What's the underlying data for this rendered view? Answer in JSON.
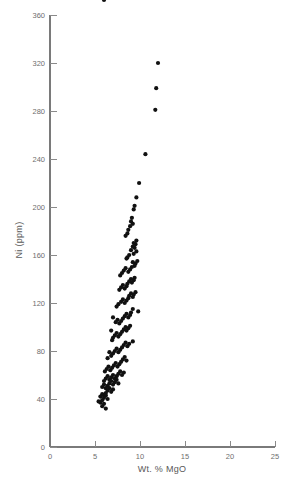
{
  "chart_data": {
    "type": "scatter",
    "title": "",
    "xlabel": "Wt. % MgO",
    "ylabel": "Ni (ppm)",
    "xlim": [
      0,
      25
    ],
    "ylim": [
      0,
      360
    ],
    "xticks": [
      0,
      5,
      10,
      15,
      20,
      25
    ],
    "yticks": [
      0,
      40,
      80,
      120,
      160,
      200,
      240,
      280,
      320,
      360
    ],
    "xtick_labels": [
      "0",
      "5",
      "10",
      "15",
      "20",
      "25"
    ],
    "ytick_labels": [
      "0",
      "40",
      "80",
      "120",
      "160",
      "200",
      "240",
      "280",
      "320",
      "360"
    ],
    "grid": false,
    "legend": null,
    "marker": "filled-circle",
    "marker_color": "#111111",
    "marker_size_px": 4.0,
    "n_points": 152,
    "x": [
      12.0,
      11.8,
      11.7,
      10.6,
      9.9,
      9.6,
      9.4,
      9.3,
      9.1,
      9.0,
      9.2,
      8.9,
      8.7,
      8.6,
      8.4,
      9.6,
      9.5,
      9.4,
      9.3,
      9.2,
      9.6,
      9.3,
      9.0,
      8.8,
      8.6,
      8.5,
      9.7,
      9.5,
      9.4,
      9.2,
      9.1,
      8.9,
      8.7,
      8.4,
      8.2,
      8.0,
      7.8,
      9.4,
      9.3,
      9.1,
      9.0,
      8.8,
      8.6,
      8.5,
      8.3,
      8.1,
      7.9,
      7.7,
      9.5,
      9.3,
      9.2,
      9.0,
      8.8,
      8.7,
      8.5,
      8.3,
      8.1,
      7.9,
      7.6,
      7.4,
      9.8,
      9.2,
      9.0,
      8.9,
      8.7,
      8.5,
      8.3,
      8.1,
      7.9,
      7.7,
      7.5,
      7.3,
      7.0,
      6.8,
      8.9,
      8.7,
      8.5,
      8.4,
      8.2,
      8.0,
      7.8,
      7.6,
      7.4,
      7.2,
      7.0,
      6.9,
      9.2,
      8.8,
      8.6,
      8.4,
      8.2,
      8.0,
      7.8,
      7.6,
      7.4,
      7.2,
      7.0,
      6.8,
      6.6,
      6.4,
      8.5,
      8.3,
      8.1,
      7.9,
      7.7,
      7.5,
      7.3,
      7.1,
      6.9,
      6.7,
      6.5,
      6.3,
      6.1,
      8.2,
      8.0,
      7.8,
      7.6,
      7.4,
      7.2,
      7.0,
      6.8,
      6.6,
      6.4,
      6.2,
      6.0,
      7.6,
      7.4,
      7.2,
      7.0,
      6.8,
      6.6,
      6.4,
      6.2,
      6.0,
      5.8,
      7.0,
      6.8,
      6.6,
      6.4,
      6.2,
      6.0,
      5.8,
      5.6,
      6.4,
      6.2,
      6.0,
      5.8,
      5.6,
      5.4,
      6.0,
      5.8,
      6.2,
      6.0
    ],
    "y": [
      320,
      299,
      281,
      244,
      220,
      208,
      201,
      198,
      191,
      188,
      186,
      184,
      181,
      178,
      176,
      172,
      169,
      166,
      170,
      167,
      163,
      161,
      164,
      160,
      158,
      157,
      155,
      153,
      151,
      154,
      150,
      148,
      146,
      149,
      147,
      145,
      143,
      141,
      139,
      137,
      140,
      138,
      136,
      134,
      132,
      135,
      133,
      131,
      129,
      127,
      125,
      128,
      126,
      124,
      122,
      120,
      123,
      121,
      119,
      117,
      113,
      115,
      112,
      110,
      108,
      111,
      109,
      107,
      105,
      103,
      106,
      104,
      108,
      97,
      101,
      99,
      97,
      100,
      98,
      96,
      94,
      92,
      95,
      93,
      91,
      89,
      88,
      86,
      84,
      87,
      85,
      83,
      81,
      79,
      82,
      80,
      78,
      76,
      79,
      74,
      72,
      75,
      73,
      71,
      69,
      67,
      70,
      68,
      66,
      64,
      67,
      65,
      63,
      62,
      60,
      63,
      61,
      59,
      57,
      60,
      58,
      56,
      59,
      57,
      55,
      53,
      56,
      54,
      52,
      55,
      53,
      51,
      49,
      52,
      50,
      48,
      46,
      49,
      47,
      45,
      43,
      44,
      42,
      40,
      43,
      41,
      39,
      37,
      38,
      36,
      34,
      32
    ]
  }
}
